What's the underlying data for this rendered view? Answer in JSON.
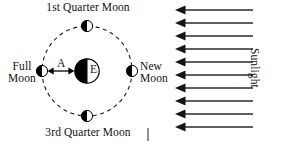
{
  "diagram": {
    "title_implied": "Phases of the Moon as seen from Earth",
    "labels": {
      "first_quarter": "1st Quarter Moon",
      "third_quarter": "3rd Quarter Moon",
      "full_moon": "Full\nMoon",
      "full_moon_line1": "Full",
      "full_moon_line2": "Moon",
      "new_moon_line1": "New",
      "new_moon_line2": "Moon",
      "distance_a": "A",
      "earth": "E",
      "sunlight": "Sunlight"
    },
    "earth": {
      "label": "E",
      "center_x": 87,
      "center_y": 71,
      "radius": 12,
      "dark_side": "left",
      "lit_side": "right"
    },
    "orbit": {
      "center_x": 87,
      "center_y": 71,
      "radius": 45,
      "style": "dashed",
      "stroke": "#1a1a1a"
    },
    "moons": [
      {
        "name": "first-quarter-moon",
        "position": "top",
        "cx": 87,
        "cy": 26,
        "r": 5.5,
        "dark_side": "left",
        "lit_side": "right"
      },
      {
        "name": "new-moon",
        "position": "right",
        "cx": 132,
        "cy": 71,
        "r": 5.5,
        "dark_side": "left",
        "lit_side": "right"
      },
      {
        "name": "third-quarter-moon",
        "position": "bottom",
        "cx": 87,
        "cy": 116,
        "r": 5.5,
        "dark_side": "left",
        "lit_side": "right"
      },
      {
        "name": "full-moon",
        "position": "left",
        "cx": 42,
        "cy": 71,
        "r": 5.5,
        "dark_side": "left",
        "lit_side": "right"
      }
    ],
    "distance_arrow": {
      "label": "A",
      "from_x": 48,
      "to_x": 74,
      "y": 71,
      "double_headed": true
    },
    "sunlight": {
      "label": "Sunlight",
      "direction": "right-to-left",
      "arrow_count": 10,
      "arrow_x_start": 253,
      "arrow_x_end": 177,
      "arrow_y_values": [
        10,
        23,
        36,
        49,
        62,
        75,
        88,
        101,
        114,
        127
      ],
      "stroke": "#2b2b2b"
    },
    "tick_mark": {
      "name": "bottom-tick-mark",
      "x": 148,
      "y_top": 128,
      "y_bottom": 141
    },
    "colors": {
      "ink": "#111111",
      "dark_fill": "#000000",
      "light_fill": "#ffffff",
      "background": "#ffffff"
    }
  }
}
